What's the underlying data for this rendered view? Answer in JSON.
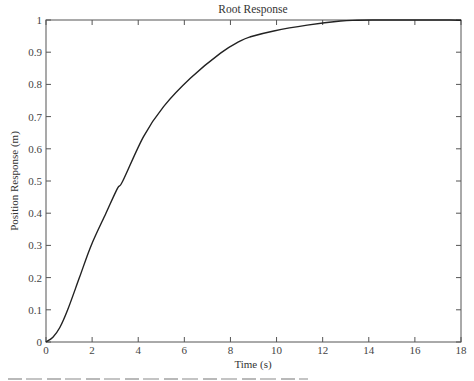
{
  "chart_data": {
    "type": "line",
    "title": "Root Response",
    "xlabel": "Time (s)",
    "ylabel": "Position Response (m)",
    "xlim": [
      0,
      18
    ],
    "ylim": [
      0,
      1
    ],
    "grid": false,
    "legend": null,
    "x_ticks": [
      0,
      2,
      4,
      6,
      8,
      10,
      12,
      14,
      16,
      18
    ],
    "x_tick_labels": [
      "0",
      "2",
      "4",
      "6",
      "8",
      "10",
      "12",
      "14",
      "16",
      "18"
    ],
    "y_ticks": [
      0,
      0.1,
      0.2,
      0.3,
      0.4,
      0.5,
      0.6,
      0.7,
      0.8,
      0.9,
      1
    ],
    "y_tick_labels": [
      "0",
      "0.1",
      "0.2",
      "0.3",
      "0.4",
      "0.5",
      "0.6",
      "0.7",
      "0.8",
      "0.9",
      "1"
    ],
    "series": [
      {
        "name": "Position response",
        "color": "#222222",
        "x": [
          0,
          0.3,
          0.6,
          0.94,
          1.45,
          1.96,
          2.6,
          3.1,
          3.33,
          4.23,
          5.1,
          6.26,
          7.57,
          8.43,
          8.87,
          9.88,
          11.33,
          12.78,
          13.5,
          14.5,
          15.5,
          16.5,
          17.5,
          18
        ],
        "y": [
          0,
          0.015,
          0.045,
          0.1,
          0.2,
          0.3,
          0.4,
          0.477,
          0.5,
          0.638,
          0.731,
          0.819,
          0.897,
          0.935,
          0.948,
          0.966,
          0.984,
          0.997,
          0.999,
          1.0,
          1.001,
          1.001,
          1.0,
          0.999
        ]
      }
    ]
  }
}
